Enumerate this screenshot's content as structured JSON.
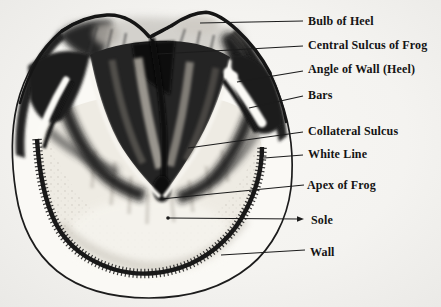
{
  "figure": {
    "colors": {
      "paper": "#f3f2ef",
      "ink": "#1c1c1c",
      "shading_dark": "#1f1f1f",
      "sole_light": "#efece5"
    },
    "labels": [
      {
        "text": "Bulb of Heel",
        "lx": 308,
        "ly": 21,
        "x1": 200,
        "y1": 23,
        "x2": 303,
        "y2": 21
      },
      {
        "text": "Central Sulcus of Frog",
        "lx": 308,
        "ly": 45,
        "x1": 158,
        "y1": 54,
        "x2": 303,
        "y2": 46
      },
      {
        "text": "Angle of Wall (Heel)",
        "lx": 308,
        "ly": 69,
        "x1": 237,
        "y1": 82,
        "x2": 303,
        "y2": 71
      },
      {
        "text": "Bars",
        "lx": 308,
        "ly": 95,
        "x1": 249,
        "y1": 108,
        "x2": 303,
        "y2": 96
      },
      {
        "text": "Collateral Sulcus",
        "lx": 308,
        "ly": 131,
        "x1": 188,
        "y1": 148,
        "x2": 303,
        "y2": 132
      },
      {
        "text": "White Line",
        "lx": 308,
        "ly": 154,
        "x1": 264,
        "y1": 158,
        "x2": 303,
        "y2": 155
      },
      {
        "text": "Apex of Frog",
        "lx": 307,
        "ly": 185,
        "x1": 161,
        "y1": 199,
        "x2": 304,
        "y2": 185
      },
      {
        "text": "Sole",
        "lx": 311,
        "ly": 220,
        "x1": 168,
        "y1": 218,
        "x2": 299,
        "y2": 219,
        "arrow": true
      },
      {
        "text": "Wall",
        "lx": 310,
        "ly": 252,
        "x1": 221,
        "y1": 255,
        "x2": 305,
        "y2": 250
      }
    ]
  }
}
